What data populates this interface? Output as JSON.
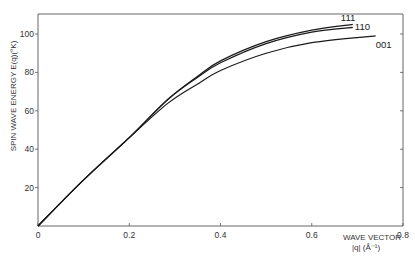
{
  "chart_data": {
    "type": "line",
    "title": "",
    "xlabel": "WAVE VECTOR |q| (Å⁻¹)",
    "xlabel_line1": "WAVE VECTOR",
    "xlabel_line2": "|q| (Å⁻¹)",
    "ylabel": "SPIN WAVE ENERGY  E(q)(°K)",
    "xlim": [
      0,
      0.8
    ],
    "ylim": [
      0,
      110
    ],
    "x_ticks": [
      "0",
      "0.2",
      "0.4",
      "0.6",
      "0.8"
    ],
    "y_ticks": [
      "20",
      "40",
      "60",
      "80",
      "100"
    ],
    "grid": false,
    "legend": "inline labels at curve ends",
    "series": [
      {
        "name": "111",
        "x": [
          0,
          0.1,
          0.2,
          0.285,
          0.35,
          0.4,
          0.5,
          0.6,
          0.69
        ],
        "values": [
          0,
          24,
          46,
          66,
          78,
          86,
          96,
          102,
          105
        ]
      },
      {
        "name": "110",
        "x": [
          0,
          0.1,
          0.2,
          0.285,
          0.35,
          0.4,
          0.5,
          0.6,
          0.69
        ],
        "values": [
          0,
          24,
          46,
          66,
          77.5,
          85,
          95,
          101,
          103.5
        ]
      },
      {
        "name": "001",
        "x": [
          0,
          0.1,
          0.2,
          0.285,
          0.35,
          0.4,
          0.5,
          0.6,
          0.74
        ],
        "values": [
          0,
          24,
          46,
          64,
          74,
          81,
          90,
          95.5,
          99
        ]
      }
    ]
  }
}
